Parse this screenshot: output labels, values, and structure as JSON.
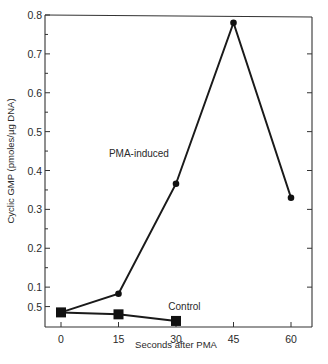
{
  "chart_data": {
    "type": "line",
    "title": "",
    "xlabel": "Seconds after PMA",
    "ylabel": "Cyclic GMP (pmoles/µg DNA)",
    "x_ticks": [
      0,
      15,
      30,
      45,
      60
    ],
    "x_tick_labels": [
      "0",
      "15",
      "30",
      "45",
      "60"
    ],
    "xlim": [
      -3,
      66
    ],
    "y_ticks": [
      0.05,
      0.1,
      0.2,
      0.3,
      0.4,
      0.5,
      0.6,
      0.7,
      0.8
    ],
    "y_tick_labels": [
      "0.5",
      "0.1",
      "0.2",
      "0.3",
      "0.4",
      "0.5",
      "0.6",
      "0.7",
      "0.8"
    ],
    "y_minor_ticks": [
      0.15,
      0.25,
      0.35,
      0.45,
      0.55,
      0.65,
      0.75
    ],
    "ylim": [
      0,
      0.8
    ],
    "grid": false,
    "series": [
      {
        "name": "PMA-induced",
        "marker": "circle",
        "x": [
          0,
          15,
          30,
          45,
          60
        ],
        "values": [
          0.035,
          0.083,
          0.366,
          0.78,
          0.33
        ]
      },
      {
        "name": "Control",
        "marker": "square",
        "x": [
          0,
          15,
          30
        ],
        "values": [
          0.035,
          0.03,
          0.013
        ]
      }
    ],
    "annotations": [
      {
        "text": "PMA-induced",
        "x": 12.5,
        "y": 0.435
      },
      {
        "text": "Control",
        "x": 28,
        "y": 0.04
      }
    ]
  }
}
